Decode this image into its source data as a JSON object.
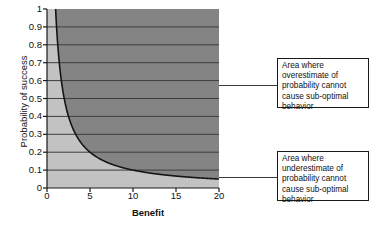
{
  "chart_data": {
    "type": "area",
    "title": "",
    "xlabel": "Benefit",
    "ylabel": "Probability of success",
    "xlim": [
      0,
      20
    ],
    "ylim": [
      0,
      1
    ],
    "grid": true,
    "legend_position": "none",
    "x_ticks": [
      {
        "value": 0,
        "label": "0"
      },
      {
        "value": 5,
        "label": "5"
      },
      {
        "value": 10,
        "label": "10"
      },
      {
        "value": 15,
        "label": "15"
      },
      {
        "value": 20,
        "label": "20"
      }
    ],
    "y_ticks": [
      {
        "value": 1,
        "label": "1"
      },
      {
        "value": 0.9,
        "label": "0.9"
      },
      {
        "value": 0.8,
        "label": "0.8"
      },
      {
        "value": 0.7,
        "label": "0.7"
      },
      {
        "value": 0.6,
        "label": "0.6"
      },
      {
        "value": 0.5,
        "label": "0.5"
      },
      {
        "value": 0.4,
        "label": "0.4"
      },
      {
        "value": 0.3,
        "label": "0.3"
      },
      {
        "value": 0.2,
        "label": "0.2"
      },
      {
        "value": 0.1,
        "label": "0.1"
      },
      {
        "value": 0,
        "label": "0"
      }
    ],
    "series": [
      {
        "name": "threshold-curve",
        "description": "Reciprocal threshold curve: probability of success = 1 / benefit",
        "x": [
          1,
          1.25,
          1.5,
          1.75,
          2,
          2.5,
          3,
          3.5,
          4,
          5,
          6,
          7,
          8,
          9,
          10,
          12,
          14,
          16,
          18,
          20
        ],
        "y": [
          1,
          0.8,
          0.667,
          0.571,
          0.5,
          0.4,
          0.333,
          0.286,
          0.25,
          0.2,
          0.167,
          0.143,
          0.125,
          0.111,
          0.1,
          0.083,
          0.071,
          0.063,
          0.056,
          0.05
        ]
      }
    ],
    "regions": [
      {
        "name": "above-curve",
        "label": "overestimate-safe-region",
        "fill": "#848484"
      },
      {
        "name": "below-curve",
        "label": "underestimate-safe-region",
        "fill": "#c2c2c2"
      }
    ],
    "colors": {
      "region_above": "#848484",
      "region_below": "#c2c2c2",
      "curve": "#151515",
      "gridline": "#3d3d3d",
      "axis": "#1a1a1a",
      "text": "#111111",
      "background": "#ffffff"
    }
  },
  "annotations": {
    "overestimate": {
      "text": "Area where overestimate of probability cannot cause sub-optimal behavior",
      "anchor_x": 20,
      "anchor_y": 0.54
    },
    "underestimate": {
      "text": "Area where underestimate of probability cannot cause sub-optimal behavior",
      "anchor_x": 20,
      "anchor_y": 0.04
    }
  }
}
